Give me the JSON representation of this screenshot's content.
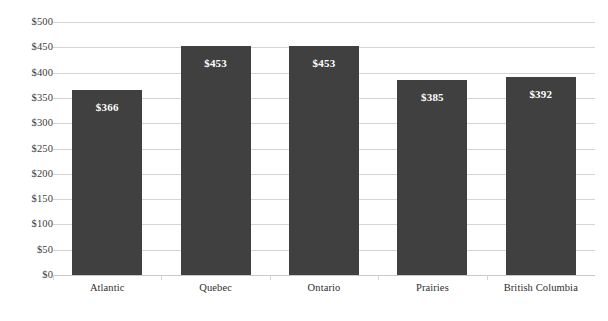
{
  "chart_data": {
    "type": "bar",
    "title": "",
    "subtitle": "",
    "xlabel": "",
    "ylabel": "",
    "categories": [
      "Atlantic",
      "Quebec",
      "Ontario",
      "Prairies",
      "British Columbia"
    ],
    "values": [
      366,
      453,
      453,
      385,
      392
    ],
    "value_labels": [
      "$366",
      "$453",
      "$453",
      "$385",
      "$392"
    ],
    "ylim": [
      0,
      500
    ],
    "ytick_values": [
      0,
      50,
      100,
      150,
      200,
      250,
      300,
      350,
      400,
      450,
      500
    ],
    "ytick_labels": [
      "$0",
      "$50",
      "$100",
      "$150",
      "$200",
      "$250",
      "$300",
      "$350",
      "$400",
      "$450",
      "$500"
    ],
    "grid": true,
    "grid_axis": "y",
    "legend": false,
    "legend_position": "none",
    "annotations": [],
    "colors": {
      "bar": "#404040",
      "value_label": "#ffffff",
      "gridline": "#d4d4d4",
      "axis_text": "#2e2e2e",
      "background": "#ffffff"
    }
  }
}
